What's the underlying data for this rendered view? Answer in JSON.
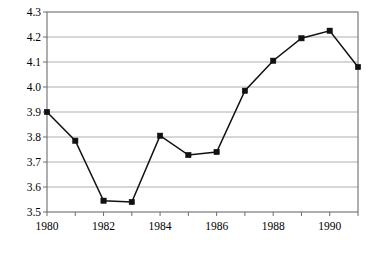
{
  "chart_data": {
    "type": "line",
    "title": "",
    "subtitle": "",
    "xlabel": "",
    "ylabel": "",
    "x": [
      1980,
      1981,
      1982,
      1983,
      1984,
      1985,
      1986,
      1987,
      1988,
      1989,
      1990,
      1991
    ],
    "values": [
      3.9,
      3.785,
      3.545,
      3.54,
      3.805,
      3.728,
      3.74,
      3.985,
      4.105,
      4.195,
      4.225,
      4.08
    ],
    "series": [
      {
        "name": "",
        "values": [
          3.9,
          3.785,
          3.545,
          3.54,
          3.805,
          3.728,
          3.74,
          3.985,
          4.105,
          4.195,
          4.225,
          4.08
        ]
      }
    ],
    "ylim": [
      3.5,
      4.3
    ],
    "xlim": [
      1980,
      1991
    ],
    "ytick_values": [
      3.5,
      3.6,
      3.7,
      3.8,
      3.9,
      4.0,
      4.1,
      4.2,
      4.3
    ],
    "ytick_labels": [
      "3.5",
      "3.6",
      "3.7",
      "3.8",
      "3.9",
      "4.0",
      "4.1",
      "4.2",
      "4.3"
    ],
    "xtick_values": [
      1980,
      1981,
      1982,
      1983,
      1984,
      1985,
      1986,
      1987,
      1988,
      1989,
      1990,
      1991
    ],
    "xtick_labels": [
      "1980",
      "",
      "1982",
      "",
      "1984",
      "",
      "1986",
      "",
      "1988",
      "",
      "1990",
      ""
    ],
    "grid": "horizontal",
    "legend": "none",
    "marker": "square",
    "line_color": "#111111",
    "marker_color": "#111111",
    "grid_color": "#9a9a9a",
    "frame_color": "#6d6d6d",
    "background_color": "#ffffff",
    "annotations": []
  },
  "plot_geometry": {
    "left": 47,
    "right": 358,
    "top": 12,
    "bottom": 212
  }
}
